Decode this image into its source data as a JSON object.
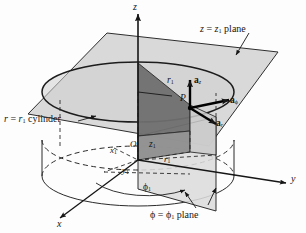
{
  "figure": {
    "type": "3d-coordinate-diagram",
    "background_color": "#fdfdfd",
    "ink_color": "#161616",
    "plane_fill": "#d6d6d6",
    "plane_fill_dark": "#8f8f8f",
    "wedge_fill": "#6f6f6f"
  },
  "axes": {
    "z": "z",
    "x": "x",
    "y": "y"
  },
  "point": {
    "label": "P",
    "origin": "O"
  },
  "unit_vectors": {
    "a_z": "a",
    "a_z_sub": "z",
    "a_phi": "a",
    "a_phi_sub": "ϕ",
    "a_r": "a",
    "a_r_sub": "r"
  },
  "coords": {
    "r1_top": "r",
    "r1_top_sub": "1",
    "z1": "z",
    "z1_sub": "1",
    "x1": "x",
    "x1_sub": "1",
    "y1": "y",
    "y1_sub": "1",
    "r1_base": "r",
    "r1_base_sub": "1",
    "phi1": "ϕ",
    "phi1_sub": "1"
  },
  "annotations": {
    "z_plane": "z = z₁ plane",
    "z_plane_text_a": "z",
    "z_plane_text_eq": " = ",
    "z_plane_text_b": "z",
    "z_plane_sub": "1",
    "z_plane_tail": " plane",
    "cylinder": "r = r₁ cylinder",
    "cylinder_a": "r",
    "cylinder_eq": " = ",
    "cylinder_b": "r",
    "cylinder_sub": "1",
    "cylinder_tail": " cylinder",
    "phi_plane": "ϕ = ϕ₁ plane",
    "phi_plane_a": "ϕ",
    "phi_plane_eq": " = ",
    "phi_plane_b": "ϕ",
    "phi_plane_sub": "1",
    "phi_plane_tail": " plane"
  }
}
